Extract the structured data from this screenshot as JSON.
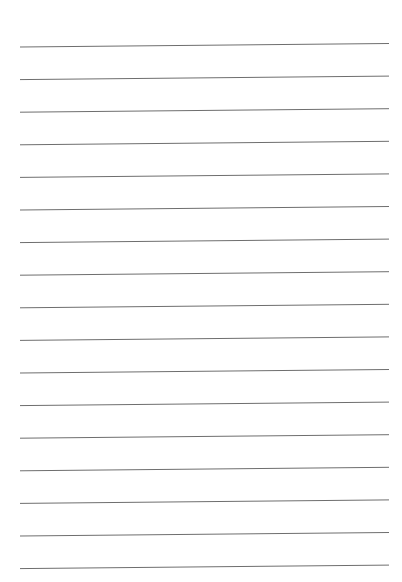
{
  "document": {
    "type": "lined-paper",
    "background_color": "#ffffff",
    "line_color": "#6e6e6e",
    "line_count": 17,
    "line_left_x": 20,
    "line_right_x": 389,
    "first_line_y_left": 47,
    "line_spacing": 32.6,
    "slope_right_offset": -3.5
  }
}
